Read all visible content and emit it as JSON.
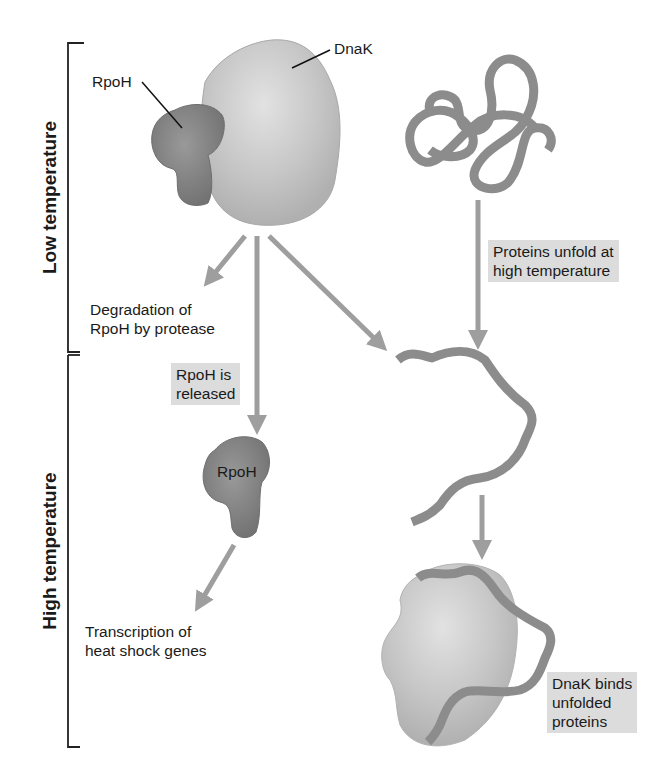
{
  "diagram": {
    "type": "biological-pathway",
    "colors": {
      "dnak": "#c4c4c4",
      "rpoh": "#858585",
      "protein_strand": "#8c8c8c",
      "arrow": "#9e9e9e",
      "label_box": "#dcdcdc",
      "bracket": "#222222"
    },
    "sections": {
      "low": "Low temperature",
      "high": "High temperature"
    },
    "labels": {
      "dnak_top": "DnaK",
      "rpoh_top": "RpoH",
      "rpoh_free": "RpoH",
      "degradation": [
        "Degradation of",
        "RpoH by protease"
      ],
      "released": [
        "RpoH is",
        "released"
      ],
      "unfold": [
        "Proteins unfold at",
        "high temperature"
      ],
      "transcription": [
        "Transcription of",
        "heat shock genes"
      ],
      "binds": [
        "DnaK binds",
        "unfolded",
        "proteins"
      ]
    },
    "nodes": [
      {
        "id": "dnak-rpoh-complex",
        "section": "low",
        "label": "DnaK + RpoH"
      },
      {
        "id": "folded-protein",
        "section": "low",
        "label": "folded protein"
      },
      {
        "id": "degradation",
        "section": "low",
        "label": "Degradation of RpoH by protease"
      },
      {
        "id": "free-rpoh",
        "section": "high",
        "label": "RpoH"
      },
      {
        "id": "unfolded-protein",
        "section": "high",
        "label": "unfolded protein"
      },
      {
        "id": "transcription",
        "section": "high",
        "label": "Transcription of heat shock genes"
      },
      {
        "id": "dnak-bound",
        "section": "high",
        "label": "DnaK binds unfolded proteins"
      }
    ],
    "edges": [
      {
        "from": "dnak-rpoh-complex",
        "to": "degradation"
      },
      {
        "from": "dnak-rpoh-complex",
        "to": "free-rpoh",
        "label": "RpoH is released"
      },
      {
        "from": "dnak-rpoh-complex",
        "to": "unfolded-protein"
      },
      {
        "from": "folded-protein",
        "to": "unfolded-protein",
        "label": "Proteins unfold at high temperature"
      },
      {
        "from": "free-rpoh",
        "to": "transcription"
      },
      {
        "from": "unfolded-protein",
        "to": "dnak-bound"
      }
    ]
  }
}
